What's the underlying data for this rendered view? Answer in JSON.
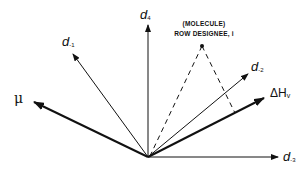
{
  "diagram": {
    "colors": {
      "ink": "#111111",
      "background": "#ffffff"
    },
    "origin": {
      "x": 148,
      "y": 157
    },
    "vectors": [
      {
        "id": "d4",
        "symbol": "d",
        "subscript": "4",
        "tip": {
          "x": 148,
          "y": 25
        },
        "weight": "thin"
      },
      {
        "id": "d-1",
        "symbol": "d",
        "subscript": "-1",
        "tip": {
          "x": 73,
          "y": 54
        },
        "weight": "thin"
      },
      {
        "id": "mu",
        "symbol": "μ",
        "subscript": "",
        "tip": {
          "x": 34,
          "y": 102
        },
        "weight": "bold"
      },
      {
        "id": "d-2",
        "symbol": "d",
        "subscript": "-2",
        "tip": {
          "x": 248,
          "y": 74
        },
        "weight": "thin"
      },
      {
        "id": "dHv",
        "symbol": "ΔH",
        "subscript": "v",
        "tip": {
          "x": 264,
          "y": 98
        },
        "weight": "bold"
      },
      {
        "id": "d-3",
        "symbol": "d",
        "subscript": "-3",
        "tip": {
          "x": 278,
          "y": 157
        },
        "weight": "thin"
      }
    ],
    "point": {
      "label_line1": "(MOLECULE)",
      "label_line2": "ROW DESIGNEE, i",
      "position": {
        "x": 202,
        "y": 46
      }
    },
    "dashed_lines": [
      {
        "from": "point",
        "to": "origin"
      },
      {
        "from": "point",
        "to": "projection-on-dHv",
        "end": {
          "x": 235,
          "y": 113
        }
      }
    ]
  },
  "labels": {
    "d4": {
      "symbol": "d",
      "sub": "4"
    },
    "dm1": {
      "symbol": "d",
      "sub": "-1"
    },
    "mu": {
      "symbol": "μ"
    },
    "dm2": {
      "symbol": "d",
      "sub": "-2"
    },
    "dhv": {
      "symbol": "ΔH",
      "sub": "v"
    },
    "dm3": {
      "symbol": "d",
      "sub": "-3"
    },
    "molecule": {
      "line1": "(MOLECULE)",
      "line2": "ROW DESIGNEE, i"
    }
  }
}
